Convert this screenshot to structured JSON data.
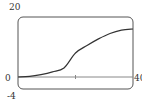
{
  "chart_data": {
    "type": "line",
    "title": "",
    "xlabel": "",
    "ylabel": "",
    "xlim": [
      0,
      40
    ],
    "ylim": [
      -4,
      20
    ],
    "x_tick_labels": [
      "0",
      "40"
    ],
    "y_tick_labels": [
      "20",
      "-4"
    ],
    "x_ticks_unlabeled": [
      20
    ],
    "grid": false,
    "series": [
      {
        "name": "curve",
        "x": [
          0,
          4,
          8,
          12,
          16,
          20,
          24,
          28,
          32,
          36,
          40
        ],
        "values": [
          0,
          0.2,
          0.8,
          1.7,
          3.0,
          8.0,
          10.5,
          12.7,
          14.5,
          15.6,
          16.0
        ]
      }
    ],
    "colors": {
      "axis": "#555555",
      "curve": "#333333",
      "frame": "#555555"
    }
  }
}
